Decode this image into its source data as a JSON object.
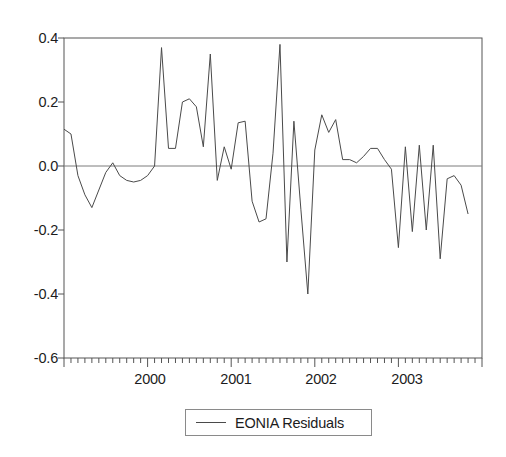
{
  "chart_data": {
    "type": "line",
    "title": "",
    "subtitle": "",
    "xlabel": "",
    "ylabel": "",
    "xlim": [
      "1999-01",
      "2003-12"
    ],
    "ylim": [
      -0.6,
      0.4
    ],
    "grid": false,
    "zero_line": true,
    "legend_position": "bottom-center",
    "y_ticks": [
      "0.4",
      "0.2",
      "0.0",
      "-0.2",
      "-0.4",
      "-0.6"
    ],
    "y_tick_values": [
      0.4,
      0.2,
      0.0,
      -0.2,
      -0.4,
      -0.6
    ],
    "x_ticks": [
      "2000",
      "2001",
      "2002",
      "2003"
    ],
    "x_tick_values": [
      2000,
      2001,
      2002,
      2003
    ],
    "x_minor_tick_interval": "month",
    "line_color": "#4a4a4a",
    "axis_color": "#555555",
    "zero_line_color": "#777777",
    "series": [
      {
        "name": "EONIA Residuals",
        "x": [
          "1999-01",
          "1999-02",
          "1999-03",
          "1999-04",
          "1999-05",
          "1999-06",
          "1999-07",
          "1999-08",
          "1999-09",
          "1999-10",
          "1999-11",
          "1999-12",
          "2000-01",
          "2000-02",
          "2000-03",
          "2000-04",
          "2000-05",
          "2000-06",
          "2000-07",
          "2000-08",
          "2000-09",
          "2000-10",
          "2000-11",
          "2000-12",
          "2001-01",
          "2001-02",
          "2001-03",
          "2001-04",
          "2001-05",
          "2001-06",
          "2001-07",
          "2001-08",
          "2001-09",
          "2001-10",
          "2001-11",
          "2001-12",
          "2002-01",
          "2002-02",
          "2002-03",
          "2002-04",
          "2002-05",
          "2002-06",
          "2002-07",
          "2002-08",
          "2002-09",
          "2002-10",
          "2002-11",
          "2002-12",
          "2003-01",
          "2003-02",
          "2003-03",
          "2003-04",
          "2003-05",
          "2003-06",
          "2003-07",
          "2003-08",
          "2003-09",
          "2003-10",
          "2003-11"
        ],
        "values": [
          0.115,
          0.1,
          -0.03,
          -0.09,
          -0.13,
          -0.075,
          -0.02,
          0.01,
          -0.03,
          -0.045,
          -0.05,
          -0.045,
          -0.03,
          0.0,
          0.37,
          0.055,
          0.055,
          0.2,
          0.21,
          0.185,
          0.06,
          0.35,
          -0.045,
          0.06,
          -0.01,
          0.135,
          0.14,
          -0.11,
          -0.175,
          -0.165,
          0.04,
          0.38,
          -0.3,
          0.14,
          -0.135,
          -0.4,
          0.05,
          0.16,
          0.105,
          0.145,
          0.02,
          0.02,
          0.01,
          0.03,
          0.055,
          0.055,
          0.02,
          -0.01,
          -0.255,
          0.06,
          -0.205,
          0.065,
          -0.2,
          0.065,
          -0.29,
          -0.04,
          -0.03,
          -0.06,
          -0.15
        ]
      }
    ]
  },
  "legend": {
    "label": "EONIA Residuals"
  },
  "axes": {
    "y_labels": [
      "0.4",
      "0.2",
      "0.0",
      "-0.2",
      "-0.4",
      "-0.6"
    ],
    "x_labels": [
      "2000",
      "2001",
      "2002",
      "2003"
    ]
  }
}
